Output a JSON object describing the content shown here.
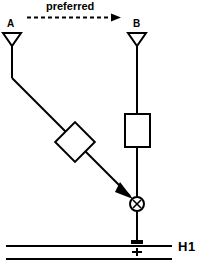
{
  "diagram": {
    "title_annotation": "preferred",
    "direction_arrow": "dashed-right-arrow",
    "antenna_a_label": "A",
    "antenna_b_label": "B",
    "bus_label": "H1",
    "polarity_marker": "+",
    "mixer_symbol": "⊗",
    "stroke_color": "#000000",
    "fill_color": "#ffffff",
    "background_color": "#ffffff",
    "nodes": [
      {
        "name": "antenna-a",
        "type": "antenna",
        "label": "A",
        "x": 12,
        "y": 39
      },
      {
        "name": "antenna-b",
        "type": "antenna",
        "label": "B",
        "x": 137,
        "y": 39
      },
      {
        "name": "diamond-component",
        "type": "diamond",
        "label": "",
        "x": 75,
        "y": 142
      },
      {
        "name": "rectangle-component",
        "type": "rectangle",
        "label": "",
        "x": 137,
        "y": 130
      },
      {
        "name": "mixer",
        "type": "circle-x",
        "label": "⊗",
        "x": 137,
        "y": 204
      },
      {
        "name": "bus-tap",
        "type": "terminal",
        "label": "+",
        "x": 137,
        "y": 246
      }
    ],
    "edges": [
      {
        "from": "antenna-a",
        "to": "diamond-component",
        "style": "solid"
      },
      {
        "from": "diamond-component",
        "to": "mixer",
        "style": "solid-arrow"
      },
      {
        "from": "antenna-b",
        "to": "rectangle-component",
        "style": "solid"
      },
      {
        "from": "rectangle-component",
        "to": "mixer",
        "style": "solid"
      },
      {
        "from": "mixer",
        "to": "bus-tap",
        "style": "solid"
      }
    ],
    "bus_lines": 2
  }
}
